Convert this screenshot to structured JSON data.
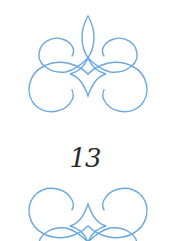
{
  "page": {
    "number": "13",
    "ornament_color": "#6aa8e0",
    "text_color": "#2a2a2a"
  },
  "ornaments": [
    {
      "position": "top",
      "type": "flourish-divider"
    },
    {
      "position": "bottom",
      "type": "flourish-divider",
      "flipped": true
    }
  ]
}
